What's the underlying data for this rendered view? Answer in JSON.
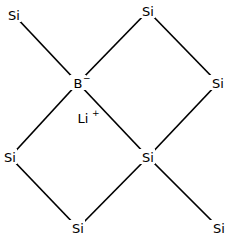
{
  "diagram": {
    "type": "chemical-structure",
    "colors": {
      "bond": "#000000",
      "label": "#000000",
      "background": "#ffffff"
    },
    "atoms": [
      {
        "id": "si1",
        "element": "Si",
        "label": "Si",
        "charge": "",
        "x": 14,
        "y": 15
      },
      {
        "id": "si2",
        "element": "Si",
        "label": "Si",
        "charge": "",
        "x": 148,
        "y": 11
      },
      {
        "id": "b1",
        "element": "B",
        "label": "B",
        "charge": "−",
        "x": 78,
        "y": 83
      },
      {
        "id": "si3",
        "element": "Si",
        "label": "Si",
        "charge": "",
        "x": 218,
        "y": 83
      },
      {
        "id": "li1",
        "element": "Li",
        "label": "Li",
        "charge": "+",
        "x": 83,
        "y": 118
      },
      {
        "id": "si4",
        "element": "Si",
        "label": "Si",
        "charge": "",
        "x": 10,
        "y": 157
      },
      {
        "id": "si5",
        "element": "Si",
        "label": "Si",
        "charge": "",
        "x": 148,
        "y": 157
      },
      {
        "id": "si6",
        "element": "Si",
        "label": "Si",
        "charge": "",
        "x": 78,
        "y": 228
      },
      {
        "id": "si7",
        "element": "Si",
        "label": "Si",
        "charge": "",
        "x": 219,
        "y": 228
      }
    ],
    "bonds": [
      {
        "from": "si1",
        "to": "b1"
      },
      {
        "from": "b1",
        "to": "si2"
      },
      {
        "from": "si2",
        "to": "si3"
      },
      {
        "from": "si3",
        "to": "si5"
      },
      {
        "from": "b1",
        "to": "si5"
      },
      {
        "from": "b1",
        "to": "si4"
      },
      {
        "from": "si4",
        "to": "si6"
      },
      {
        "from": "si6",
        "to": "si5"
      },
      {
        "from": "si5",
        "to": "si7"
      }
    ]
  }
}
